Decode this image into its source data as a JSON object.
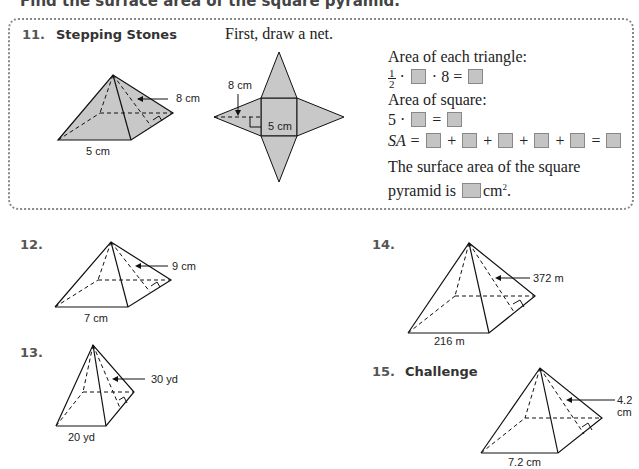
{
  "instruction": "Find the surface area of the square pyramid.",
  "problem11": {
    "number": "11.",
    "heading": "Stepping Stones",
    "prompt": "First, draw a net.",
    "pyramid_labels": {
      "slant": "8 cm",
      "base": "5 cm"
    },
    "net_labels": {
      "slant": "8 cm",
      "base": "5 cm"
    },
    "steps": {
      "triangle_label": "Area of each triangle:",
      "triangle_frac_num": "1",
      "triangle_frac_den": "2",
      "triangle_mid": "· ",
      "triangle_times8": " · 8 = ",
      "square_label": "Area of square:",
      "square_eq_prefix": "5 · ",
      "square_eq_mid": " = ",
      "sa_prefix": "SA = ",
      "plus": " + ",
      "equals": " = ",
      "conclusion_line1": "The surface area of the square",
      "conclusion_line2_prefix": "pyramid is ",
      "conclusion_unit": "cm",
      "conclusion_exp": "2",
      "conclusion_end": "."
    }
  },
  "problem12": {
    "number": "12.",
    "slant": "9 cm",
    "base": "7 cm"
  },
  "problem13": {
    "number": "13.",
    "slant": "30 yd",
    "base": "20 yd"
  },
  "problem14": {
    "number": "14.",
    "slant": "372 m",
    "base": "216 m"
  },
  "problem15": {
    "number": "15.",
    "heading": "Challenge",
    "slant": "4.2 cm",
    "base": "7.2 cm"
  },
  "colors": {
    "shade": "#c8c8c8",
    "border": "#888888",
    "line": "#111111"
  }
}
